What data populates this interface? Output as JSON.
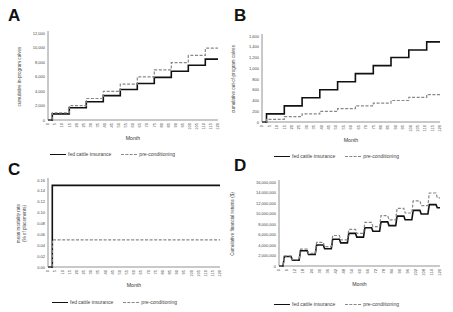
{
  "legend": {
    "solid_label": "fed cattle insurance",
    "dashed_label": "pre-conditioning",
    "solid_color": "#111111",
    "dashed_color": "#888888"
  },
  "chart_data": [
    {
      "panel": "A",
      "type": "line",
      "title": "",
      "xlabel": "Month",
      "ylabel": "cumulative in-program calves",
      "ylim": [
        0,
        12000
      ],
      "yticks": [
        "0",
        "2,000",
        "4,000",
        "6,000",
        "8,000",
        "10,000",
        "12,000"
      ],
      "xticks": [
        "0",
        "5",
        "10",
        "15",
        "20",
        "25",
        "30",
        "35",
        "40",
        "45",
        "50",
        "55",
        "60",
        "65",
        "70",
        "75",
        "80",
        "85",
        "90",
        "95",
        "100",
        "105",
        "110",
        "115",
        "120"
      ],
      "grid": false,
      "legend_position": "bottom",
      "x": [
        0,
        3,
        15,
        27,
        39,
        51,
        63,
        75,
        87,
        99,
        111,
        120
      ],
      "series": [
        {
          "name": "fed cattle insurance",
          "style": "solid",
          "values": [
            0,
            840,
            1680,
            2520,
            3360,
            4200,
            5040,
            5880,
            6720,
            7560,
            8400,
            8400
          ]
        },
        {
          "name": "pre-conditioning",
          "style": "dashed",
          "values": [
            0,
            990,
            1980,
            2970,
            3960,
            4950,
            5940,
            6930,
            7920,
            8910,
            9900,
            9900
          ]
        }
      ]
    },
    {
      "panel": "B",
      "type": "line",
      "title": "",
      "xlabel": "Month",
      "ylabel": "cumulative out-of-program calves",
      "ylim": [
        0,
        1600
      ],
      "yticks": [
        "0",
        "200",
        "400",
        "600",
        "800",
        "1,000",
        "1,200",
        "1,400",
        "1,600"
      ],
      "xticks": [
        "0",
        "5",
        "10",
        "15",
        "20",
        "25",
        "30",
        "35",
        "40",
        "45",
        "50",
        "55",
        "60",
        "65",
        "70",
        "75",
        "80",
        "85",
        "90",
        "95",
        "100",
        "105",
        "110",
        "115",
        "120"
      ],
      "grid": false,
      "legend_position": "bottom",
      "x": [
        0,
        3,
        15,
        27,
        39,
        51,
        63,
        75,
        87,
        99,
        111,
        120
      ],
      "series": [
        {
          "name": "fed cattle insurance",
          "style": "solid",
          "values": [
            0,
            150,
            300,
            450,
            600,
            750,
            900,
            1050,
            1200,
            1340,
            1490,
            1490
          ]
        },
        {
          "name": "pre-conditioning",
          "style": "dashed",
          "values": [
            0,
            50,
            100,
            150,
            200,
            250,
            300,
            350,
            400,
            460,
            510,
            510
          ]
        }
      ]
    },
    {
      "panel": "C",
      "type": "line",
      "title": "",
      "xlabel": "Month",
      "ylabel": "mean mortality rate (% of placements)",
      "ylim": [
        0,
        0.16
      ],
      "yticks": [
        "0.00",
        "0.02",
        "0.04",
        "0.06",
        "0.08",
        "0.10",
        "0.12",
        "0.14",
        "0.16"
      ],
      "xticks": [
        "0",
        "5",
        "10",
        "15",
        "20",
        "25",
        "30",
        "35",
        "40",
        "45",
        "50",
        "55",
        "60",
        "65",
        "70",
        "75",
        "80",
        "85",
        "90",
        "95",
        "100",
        "105",
        "110",
        "115",
        "120"
      ],
      "grid": false,
      "legend_position": "bottom",
      "x": [
        0,
        3,
        120
      ],
      "series": [
        {
          "name": "fed cattle insurance",
          "style": "solid",
          "values": [
            0,
            0.15,
            0.15
          ]
        },
        {
          "name": "pre-conditioning",
          "style": "dashed",
          "values": [
            0,
            0.05,
            0.05
          ]
        }
      ]
    },
    {
      "panel": "D",
      "type": "line",
      "title": "",
      "xlabel": "Month",
      "ylabel": "Cumulative financial returns ($)",
      "ylim": [
        0,
        16000000
      ],
      "yticks": [
        "0",
        "2,000,000",
        "4,000,000",
        "6,000,000",
        "8,000,000",
        "10,000,000",
        "12,000,000",
        "14,000,000",
        "16,000,000"
      ],
      "xticks": [
        "0",
        "6",
        "12",
        "18",
        "24",
        "30",
        "36",
        "42",
        "48",
        "54",
        "60",
        "66",
        "72",
        "78",
        "84",
        "90",
        "96",
        "102",
        "108",
        "114",
        "120"
      ],
      "grid": false,
      "legend_position": "bottom",
      "x": [
        0,
        3,
        4,
        9,
        10,
        15,
        16,
        21,
        22,
        27,
        28,
        33,
        34,
        39,
        40,
        45,
        46,
        51,
        52,
        57,
        58,
        63,
        64,
        69,
        70,
        75,
        76,
        81,
        82,
        87,
        88,
        93,
        94,
        99,
        100,
        105,
        106,
        111,
        112,
        117,
        118,
        120
      ],
      "series": [
        {
          "name": "fed cattle insurance",
          "style": "solid",
          "values": [
            0,
            0,
            1800000,
            1800000,
            1100000,
            1100000,
            2900000,
            2900000,
            2200000,
            2200000,
            4000000,
            4000000,
            3300000,
            3300000,
            5100000,
            5100000,
            4400000,
            4400000,
            6200000,
            6200000,
            5500000,
            5500000,
            7300000,
            7300000,
            6600000,
            6600000,
            8400000,
            8400000,
            7700000,
            7700000,
            9500000,
            9500000,
            8800000,
            8800000,
            10600000,
            10600000,
            9900000,
            9900000,
            11700000,
            11700000,
            11100000,
            11100000
          ]
        },
        {
          "name": "pre-conditioning",
          "style": "dashed",
          "values": [
            0,
            0,
            1900000,
            1900000,
            1200000,
            1200000,
            3200000,
            3200000,
            2400000,
            2400000,
            4500000,
            4500000,
            3700000,
            3700000,
            5800000,
            5800000,
            5000000,
            5000000,
            7000000,
            7000000,
            6200000,
            6200000,
            8300000,
            8300000,
            7500000,
            7500000,
            9600000,
            9600000,
            8800000,
            8800000,
            11000000,
            11000000,
            10100000,
            10100000,
            12400000,
            12400000,
            11500000,
            11500000,
            13900000,
            13900000,
            13000000,
            13000000
          ]
        }
      ]
    }
  ],
  "panels": {
    "A": {
      "letter": "A"
    },
    "B": {
      "letter": "B"
    },
    "C": {
      "letter": "C"
    },
    "D": {
      "letter": "D"
    }
  }
}
